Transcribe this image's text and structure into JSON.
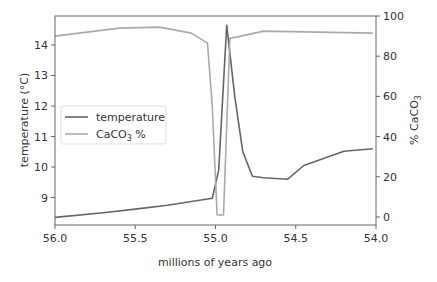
{
  "chart_data": {
    "type": "line",
    "title": "",
    "xlabel": "millions of years ago",
    "ylabel": "temperature (°C)",
    "ylabel_right": "% CaCO3",
    "x_inverted": true,
    "xlim": [
      56.0,
      54.0
    ],
    "ylim": [
      8.1,
      14.95
    ],
    "ylim_right": [
      -4,
      100
    ],
    "grid": false,
    "legend_position": "center left",
    "x_ticks": [
      "56.0",
      "55.5",
      "55.0",
      "54.5",
      "54.0"
    ],
    "y_ticks": [
      "9",
      "10",
      "11",
      "12",
      "13",
      "14"
    ],
    "y_ticks_right": [
      "0",
      "20",
      "40",
      "60",
      "80",
      "100"
    ],
    "series": [
      {
        "name": "temperature",
        "axis": "left",
        "color": "#666666",
        "x": [
          56.0,
          55.7,
          55.5,
          55.3,
          55.02,
          54.98,
          54.93,
          54.88,
          54.83,
          54.77,
          54.7,
          54.55,
          54.45,
          54.2,
          54.02
        ],
        "y": [
          8.35,
          8.5,
          8.62,
          8.75,
          8.98,
          9.9,
          14.65,
          12.3,
          10.5,
          9.7,
          9.65,
          9.6,
          10.05,
          10.52,
          10.6
        ]
      },
      {
        "name": "CaCO3 %",
        "axis": "right",
        "color": "#aaaaaa",
        "x": [
          56.0,
          55.6,
          55.35,
          55.15,
          55.05,
          55.02,
          54.99,
          54.95,
          54.91,
          54.87,
          54.7,
          54.02
        ],
        "y": [
          90,
          94,
          94.5,
          91.5,
          86.5,
          55,
          1,
          1,
          89,
          89.5,
          92.5,
          91.5
        ]
      }
    ]
  },
  "legend": {
    "items": [
      {
        "label": "temperature",
        "color": "#666666"
      },
      {
        "label": "CaCO3 %",
        "color": "#aaaaaa"
      }
    ]
  }
}
